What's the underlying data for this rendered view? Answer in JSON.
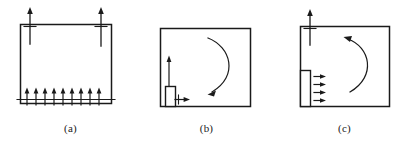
{
  "figure": {
    "type": "engineering-diagram",
    "background_color": "#ffffff",
    "stroke_color": "#1a1a1a",
    "panel_count": 3
  },
  "panels": [
    {
      "id": "a",
      "caption": "(a)",
      "box": {
        "x": 20,
        "y": 24,
        "width": 91,
        "height": 79
      },
      "annotations": [
        {
          "name": "top-left-traction-arrow",
          "kind": "straight-arrow",
          "direction": "up",
          "crosses_boundary": true,
          "x": 30,
          "tip_y": 8,
          "tail_y": 44,
          "tick_y": 26
        },
        {
          "name": "top-right-traction-arrow",
          "kind": "straight-arrow",
          "direction": "up",
          "crosses_boundary": true,
          "x": 101,
          "tip_y": 8,
          "tail_y": 44,
          "tick_y": 26
        },
        {
          "name": "bottom-distributed-load-arrows",
          "kind": "arrow-row",
          "direction": "up",
          "count": 10,
          "first_x": 27,
          "spacing": 9,
          "tip_y": 88,
          "tail_y": 105,
          "baseline_y": 99,
          "baseline_x1": 18,
          "baseline_x2": 114
        }
      ]
    },
    {
      "id": "b",
      "caption": "(b)",
      "box": {
        "x": 22,
        "y": 28,
        "width": 90,
        "height": 78
      },
      "annotations": [
        {
          "name": "indenter-block",
          "kind": "rectangle",
          "x": 27,
          "y": 86,
          "width": 10,
          "height": 20
        },
        {
          "name": "vertical-displacement-arrow",
          "kind": "straight-arrow",
          "direction": "up",
          "x": 31,
          "tip_y": 56,
          "tail_y": 86
        },
        {
          "name": "horizontal-displacement-arrow",
          "kind": "straight-arrow",
          "direction": "right",
          "y": 99,
          "tail_x": 37,
          "tip_x": 52,
          "tick_x": 40
        },
        {
          "name": "rotation-arrow",
          "kind": "curved-arrow",
          "bow": "right",
          "arrowhead_at": "bottom-left",
          "start_x": 70,
          "start_y": 38,
          "ctrl_x": 100,
          "ctrl_y": 68,
          "end_x": 72,
          "end_y": 94
        }
      ]
    },
    {
      "id": "c",
      "caption": "(c)",
      "box": {
        "x": 24,
        "y": 26,
        "width": 89,
        "height": 80
      },
      "annotations": [
        {
          "name": "top-traction-arrow",
          "kind": "straight-arrow",
          "direction": "up",
          "crosses_boundary": true,
          "x": 34,
          "tip_y": 10,
          "tail_y": 44,
          "tick_y": 28
        },
        {
          "name": "side-block",
          "kind": "rectangle",
          "x": 24,
          "y": 70,
          "width": 10,
          "height": 36
        },
        {
          "name": "shear-load-arrows",
          "kind": "arrow-column",
          "direction": "right",
          "count": 4,
          "first_y": 76,
          "spacing": 8,
          "tail_x": 38,
          "tip_x": 50
        },
        {
          "name": "rotation-arrow",
          "kind": "curved-arrow",
          "bow": "right",
          "arrowhead_at": "top-left",
          "start_x": 72,
          "start_y": 92,
          "ctrl_x": 102,
          "ctrl_y": 62,
          "end_x": 70,
          "end_y": 38
        }
      ]
    }
  ]
}
